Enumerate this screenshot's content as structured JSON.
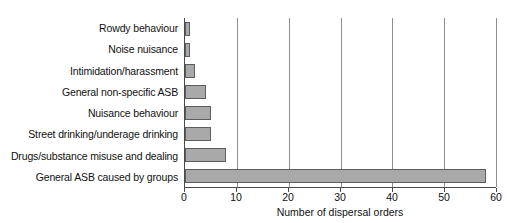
{
  "chart_data": {
    "type": "bar",
    "orientation": "horizontal",
    "title": "",
    "xlabel": "Number of dispersal orders",
    "ylabel": "",
    "xlim": [
      0,
      60
    ],
    "xticks": [
      0,
      10,
      20,
      30,
      40,
      50,
      60
    ],
    "xtick_labels": [
      "0",
      "10",
      "20",
      "30",
      "40",
      "50",
      "60"
    ],
    "grid": true,
    "legend": false,
    "categories": [
      "Rowdy behaviour",
      "Noise nuisance",
      "Intimidation/harassment",
      "General non-specific ASB",
      "Nuisance behaviour",
      "Street drinking/underage drinking",
      "Drugs/substance misuse and dealing",
      "General ASB caused by groups"
    ],
    "values": [
      1,
      1,
      2,
      4,
      5,
      5,
      8,
      58
    ],
    "bar_fill_color": "#a9a9a9",
    "bar_border_color": "#5d5d5d",
    "gridline_color": "#8e8e8e",
    "axis_color": "#4a4a4a"
  }
}
